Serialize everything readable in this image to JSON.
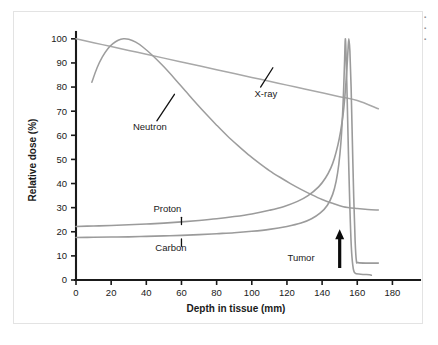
{
  "figure": {
    "edge_artifact_lines": [
      "▪",
      "▪",
      "▪"
    ]
  },
  "chart_data": {
    "type": "line",
    "title": "",
    "xlabel": "Depth in tissue (mm)",
    "ylabel": "Relative dose (%)",
    "xlim": [
      0,
      190
    ],
    "ylim": [
      0,
      102
    ],
    "xticks": [
      0,
      20,
      40,
      60,
      80,
      100,
      120,
      140,
      160,
      180
    ],
    "xtick_labels": [
      "0",
      "20",
      "40",
      "60",
      "80",
      "100",
      "120",
      "140",
      "160",
      "180"
    ],
    "yticks": [
      0,
      10,
      20,
      30,
      40,
      50,
      60,
      70,
      80,
      90,
      100
    ],
    "ytick_labels": [
      "0",
      "10",
      "20",
      "30",
      "40",
      "50",
      "60",
      "70",
      "80",
      "90",
      "100"
    ],
    "grid": false,
    "legend_position": "inline-annotations",
    "series": [
      {
        "name": "X-ray",
        "color": "#a8a8a8",
        "width": 1.5,
        "label": "X-ray",
        "label_x": 108,
        "label_y": 76,
        "leader_from_x": 105,
        "leader_from_y": 80,
        "leader_to_x": 112,
        "leader_to_y": 88,
        "points": [
          [
            0,
            100.0
          ],
          [
            10,
            98.4
          ],
          [
            20,
            96.8
          ],
          [
            30,
            95.2
          ],
          [
            40,
            93.6
          ],
          [
            50,
            92.0
          ],
          [
            60,
            90.4
          ],
          [
            70,
            88.8
          ],
          [
            80,
            87.2
          ],
          [
            90,
            85.6
          ],
          [
            100,
            84.0
          ],
          [
            110,
            82.4
          ],
          [
            120,
            80.8
          ],
          [
            130,
            79.2
          ],
          [
            140,
            77.6
          ],
          [
            150,
            76.0
          ],
          [
            160,
            74.4
          ],
          [
            172,
            71.0
          ]
        ]
      },
      {
        "name": "Neutron",
        "color": "#9d9d9d",
        "width": 1.5,
        "label": "Neutron",
        "label_x": 42,
        "label_y": 62,
        "leader_from_x": 46,
        "leader_from_y": 66,
        "leader_to_x": 56,
        "leader_to_y": 77,
        "points": [
          [
            9,
            82.0
          ],
          [
            12,
            88.0
          ],
          [
            15,
            92.5
          ],
          [
            18,
            95.8
          ],
          [
            21,
            98.0
          ],
          [
            24,
            99.4
          ],
          [
            27,
            100.0
          ],
          [
            30,
            99.8
          ],
          [
            34,
            98.6
          ],
          [
            38,
            96.6
          ],
          [
            44,
            92.8
          ],
          [
            50,
            88.4
          ],
          [
            56,
            83.6
          ],
          [
            62,
            78.6
          ],
          [
            68,
            73.6
          ],
          [
            74,
            68.8
          ],
          [
            80,
            64.2
          ],
          [
            86,
            59.8
          ],
          [
            92,
            55.8
          ],
          [
            98,
            52.0
          ],
          [
            104,
            48.6
          ],
          [
            110,
            45.4
          ],
          [
            116,
            42.6
          ],
          [
            122,
            40.0
          ],
          [
            128,
            37.6
          ],
          [
            134,
            35.4
          ],
          [
            140,
            33.4
          ],
          [
            146,
            31.8
          ],
          [
            152,
            30.4
          ],
          [
            160,
            29.6
          ],
          [
            166,
            29.2
          ],
          [
            172,
            29.0
          ]
        ]
      },
      {
        "name": "Proton",
        "color": "#9b9b9b",
        "width": 1.6,
        "label": "Proton",
        "label_x": 52,
        "label_y": 28,
        "leader_from_x": 60,
        "leader_from_y": 26,
        "leader_to_x": 60,
        "leader_to_y": 23,
        "peak_depth": 155,
        "peak_value": 100,
        "points": [
          [
            0,
            22.2
          ],
          [
            10,
            22.4
          ],
          [
            20,
            22.6
          ],
          [
            30,
            22.9
          ],
          [
            40,
            23.2
          ],
          [
            50,
            23.6
          ],
          [
            60,
            24.1
          ],
          [
            70,
            24.7
          ],
          [
            80,
            25.4
          ],
          [
            90,
            26.3
          ],
          [
            100,
            27.4
          ],
          [
            110,
            28.9
          ],
          [
            118,
            30.4
          ],
          [
            126,
            32.6
          ],
          [
            132,
            35.0
          ],
          [
            138,
            38.6
          ],
          [
            142,
            42.4
          ],
          [
            145,
            46.5
          ],
          [
            147,
            50.5
          ],
          [
            149,
            56.0
          ],
          [
            150.5,
            61.5
          ],
          [
            152,
            69.0
          ],
          [
            153,
            76.5
          ],
          [
            154,
            86.5
          ],
          [
            154.7,
            95.0
          ],
          [
            155.2,
            100.0
          ],
          [
            155.8,
            95.0
          ],
          [
            156.5,
            80.0
          ],
          [
            157.2,
            58.0
          ],
          [
            158,
            34.0
          ],
          [
            158.8,
            16.0
          ],
          [
            159.5,
            8.0
          ],
          [
            160.5,
            7.2
          ],
          [
            166,
            7.0
          ],
          [
            172,
            7.0
          ]
        ]
      },
      {
        "name": "Carbon",
        "color": "#9b9b9b",
        "width": 1.6,
        "label": "Carbon",
        "label_x": 54,
        "label_y": 12,
        "leader_from_x": 60,
        "leader_from_y": 14,
        "leader_to_x": 60,
        "leader_to_y": 17,
        "peak_depth": 153,
        "peak_value": 100,
        "points": [
          [
            0,
            17.6
          ],
          [
            10,
            17.7
          ],
          [
            20,
            17.8
          ],
          [
            30,
            17.9
          ],
          [
            40,
            18.1
          ],
          [
            50,
            18.3
          ],
          [
            60,
            18.5
          ],
          [
            70,
            18.8
          ],
          [
            80,
            19.2
          ],
          [
            90,
            19.6
          ],
          [
            100,
            20.2
          ],
          [
            110,
            21.0
          ],
          [
            120,
            22.2
          ],
          [
            128,
            23.6
          ],
          [
            134,
            25.4
          ],
          [
            139,
            27.8
          ],
          [
            143,
            31.0
          ],
          [
            146,
            35.5
          ],
          [
            148,
            41.0
          ],
          [
            149.5,
            48.0
          ],
          [
            150.7,
            57.0
          ],
          [
            151.6,
            68.0
          ],
          [
            152.3,
            80.0
          ],
          [
            152.8,
            91.0
          ],
          [
            153.2,
            100.0
          ],
          [
            153.7,
            92.0
          ],
          [
            154.3,
            74.0
          ],
          [
            155,
            52.0
          ],
          [
            155.8,
            30.0
          ],
          [
            156.6,
            14.0
          ],
          [
            157.4,
            6.5
          ],
          [
            158.5,
            3.0
          ],
          [
            162,
            2.4
          ],
          [
            167,
            2.2
          ],
          [
            168,
            2.0
          ]
        ]
      }
    ],
    "annotations": [
      {
        "name": "tumor",
        "label": "Tumor",
        "label_x": 128,
        "label_y": 8,
        "arrow_x": 150,
        "arrow_base_y": 5,
        "arrow_tip_y": 21,
        "color": "#0b0b0b"
      }
    ]
  }
}
